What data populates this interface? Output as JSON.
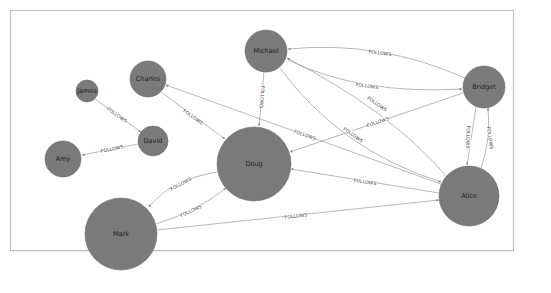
{
  "graph": {
    "title": "",
    "colors": {
      "node_fill": "#7a7a7a",
      "node_stroke": "#6a6a6a",
      "edge": "#9a9a9a",
      "label": "#1e1e1e",
      "frame": "#bdbdbd",
      "background": "#ffffff"
    },
    "nodes": [
      {
        "id": "michael",
        "label": "Michael",
        "x": 266,
        "y": 51,
        "r": 21
      },
      {
        "id": "charles",
        "label": "Charles",
        "x": 148,
        "y": 79,
        "r": 18
      },
      {
        "id": "james",
        "label": "James",
        "x": 87,
        "y": 91,
        "r": 11
      },
      {
        "id": "david",
        "label": "David",
        "x": 153,
        "y": 141,
        "r": 15
      },
      {
        "id": "amy",
        "label": "Amy",
        "x": 63,
        "y": 159,
        "r": 18
      },
      {
        "id": "doug",
        "label": "Doug",
        "x": 254,
        "y": 164,
        "r": 37
      },
      {
        "id": "mark",
        "label": "Mark",
        "x": 121,
        "y": 234,
        "r": 36
      },
      {
        "id": "bridget",
        "label": "Bridget",
        "x": 484,
        "y": 87,
        "r": 21
      },
      {
        "id": "alice",
        "label": "Alice",
        "x": 469,
        "y": 196,
        "r": 30
      }
    ],
    "edges": [
      {
        "from": "james",
        "to": "david",
        "label": "FOLLOWS"
      },
      {
        "from": "david",
        "to": "amy",
        "label": "FOLLOWS"
      },
      {
        "from": "charles",
        "to": "doug",
        "label": "FOLLOWS"
      },
      {
        "from": "michael",
        "to": "doug",
        "label": "FOLLOWS"
      },
      {
        "from": "alice",
        "to": "charles",
        "label": "FOLLOWS"
      },
      {
        "from": "bridget",
        "to": "michael",
        "label": "FOLLOWS"
      },
      {
        "from": "michael",
        "to": "bridget",
        "label": "FOLLOWS"
      },
      {
        "from": "alice",
        "to": "michael",
        "label": "FOLLOWS"
      },
      {
        "from": "michael",
        "to": "alice",
        "label": "FOLLOWS"
      },
      {
        "from": "bridget",
        "to": "doug",
        "label": "FOLLOWS"
      },
      {
        "from": "bridget",
        "to": "alice",
        "label": "FOLLOWS"
      },
      {
        "from": "alice",
        "to": "bridget",
        "label": "FOLLOWS"
      },
      {
        "from": "alice",
        "to": "doug",
        "label": "FOLLOWS"
      },
      {
        "from": "mark",
        "to": "alice",
        "label": "FOLLOWS"
      },
      {
        "from": "doug",
        "to": "mark",
        "label": "FOLLOWS"
      },
      {
        "from": "mark",
        "to": "doug",
        "label": "FOLLOWS"
      }
    ]
  }
}
